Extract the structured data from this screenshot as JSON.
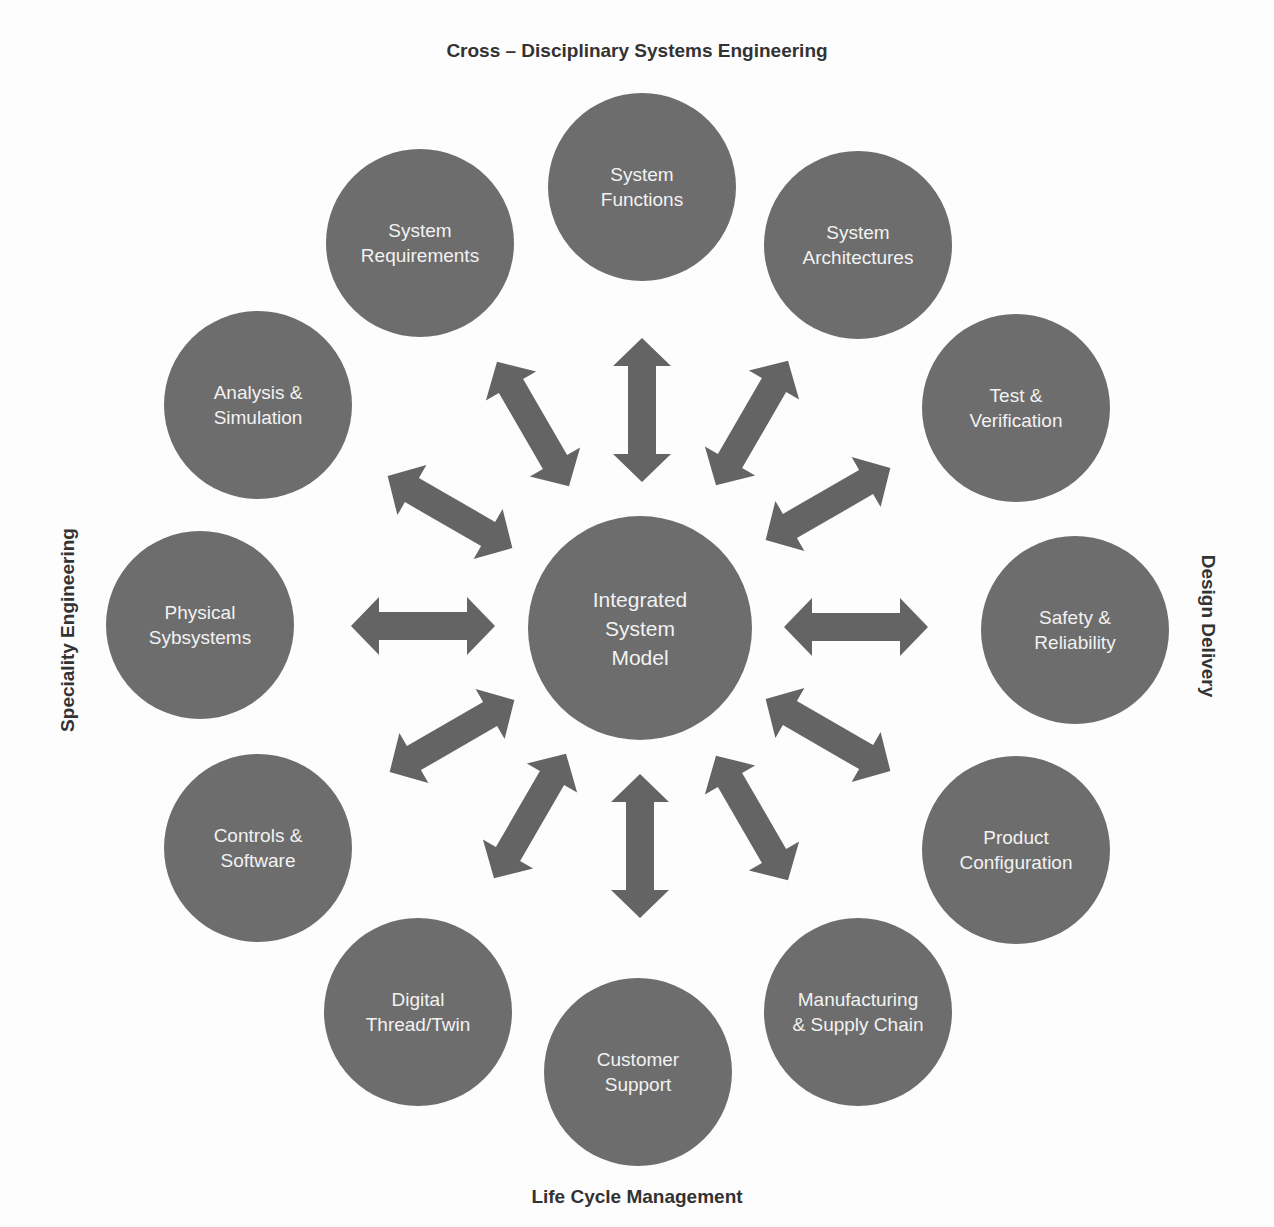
{
  "colors": {
    "node_fill": "#6d6d6d",
    "node_text": "#f2f2f2",
    "arrow_fill": "#646464",
    "label_text": "#333333",
    "background": "#fdfdfd"
  },
  "axis_labels": {
    "top": "Cross – Disciplinary Systems Engineering",
    "bottom": "Life Cycle Management",
    "left": "Speciality Engineering",
    "right": "Design Delivery"
  },
  "center_node": {
    "lines": [
      "Integrated",
      "System",
      "Model"
    ]
  },
  "nodes": [
    {
      "id": "system-functions",
      "lines": [
        "System",
        "Functions"
      ]
    },
    {
      "id": "system-architectures",
      "lines": [
        "System",
        "Architectures"
      ]
    },
    {
      "id": "test-verification",
      "lines": [
        "Test &",
        "Verification"
      ]
    },
    {
      "id": "safety-reliability",
      "lines": [
        "Safety &",
        "Reliability"
      ]
    },
    {
      "id": "product-configuration",
      "lines": [
        "Product",
        "Configuration"
      ]
    },
    {
      "id": "manufacturing-supply-chain",
      "lines": [
        "Manufacturing",
        "& Supply Chain"
      ]
    },
    {
      "id": "customer-support",
      "lines": [
        "Customer",
        "Support"
      ]
    },
    {
      "id": "digital-thread-twin",
      "lines": [
        "Digital",
        "Thread/Twin"
      ]
    },
    {
      "id": "controls-software",
      "lines": [
        "Controls &",
        "Software"
      ]
    },
    {
      "id": "physical-sybsystems",
      "lines": [
        "Physical",
        "Sybsystems"
      ]
    },
    {
      "id": "analysis-simulation",
      "lines": [
        "Analysis &",
        "Simulation"
      ]
    },
    {
      "id": "system-requirements",
      "lines": [
        "System",
        "Requirements"
      ]
    }
  ],
  "connections": {
    "type": "bidirectional-arrow",
    "from": "center_node",
    "to": "all nodes",
    "count": 12
  }
}
